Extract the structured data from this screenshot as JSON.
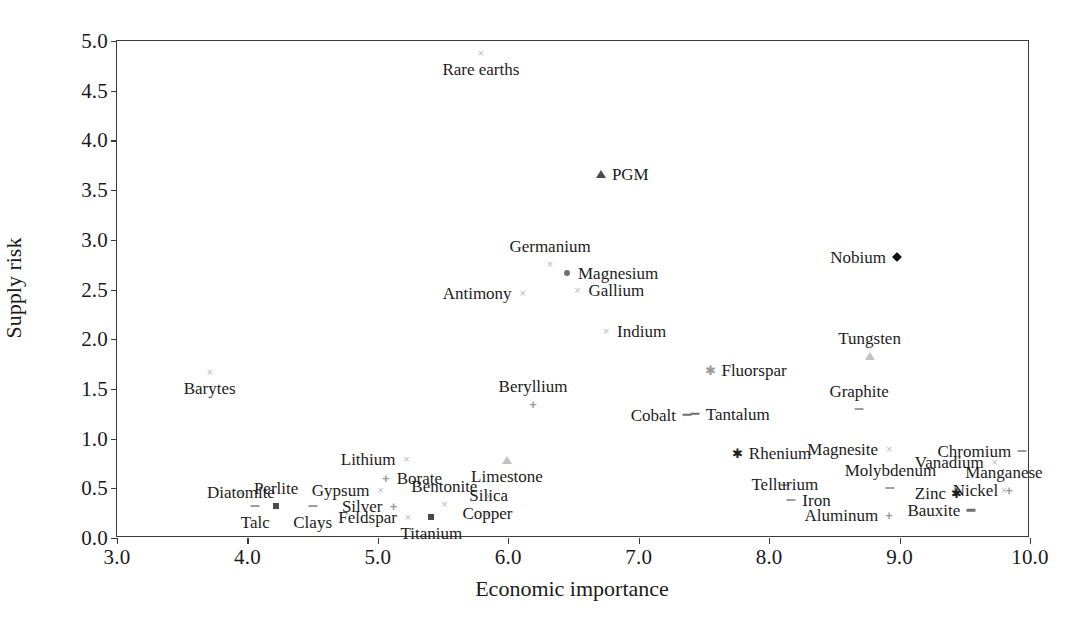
{
  "chart_data": {
    "type": "scatter",
    "title": "",
    "xlabel": "Economic importance",
    "ylabel": "Supply risk",
    "xlim": [
      3.0,
      10.0
    ],
    "ylim": [
      0.0,
      5.0
    ],
    "xticks": [
      "3.0",
      "4.0",
      "5.0",
      "6.0",
      "7.0",
      "8.0",
      "9.0",
      "10.0"
    ],
    "yticks": [
      "0.0",
      "0.5",
      "1.0",
      "1.5",
      "2.0",
      "2.5",
      "3.0",
      "3.5",
      "4.0",
      "4.5",
      "5.0"
    ],
    "grid": false,
    "legend": "none",
    "points": [
      {
        "label": "Rare earths",
        "x": 5.79,
        "y": 4.88,
        "marker": "x",
        "label_pos": "below"
      },
      {
        "label": "PGM",
        "x": 6.71,
        "y": 3.66,
        "marker": "triangle",
        "label_pos": "right"
      },
      {
        "label": "Germanium",
        "x": 6.32,
        "y": 2.76,
        "marker": "x",
        "label_pos": "above"
      },
      {
        "label": "Magnesium",
        "x": 6.45,
        "y": 2.67,
        "marker": "dot",
        "label_pos": "right"
      },
      {
        "label": "Gallium",
        "x": 6.53,
        "y": 2.5,
        "marker": "x",
        "label_pos": "right"
      },
      {
        "label": "Nobium",
        "x": 8.98,
        "y": 2.83,
        "marker": "diamond",
        "label_pos": "left"
      },
      {
        "label": "Antimony",
        "x": 6.11,
        "y": 2.46,
        "marker": "x",
        "label_pos": "left"
      },
      {
        "label": "Indium",
        "x": 6.75,
        "y": 2.08,
        "marker": "x",
        "label_pos": "right"
      },
      {
        "label": "Tungsten",
        "x": 8.77,
        "y": 1.83,
        "marker": "triangle",
        "label_pos": "above"
      },
      {
        "label": "Barytes",
        "x": 3.71,
        "y": 1.67,
        "marker": "x",
        "label_pos": "below"
      },
      {
        "label": "Fluorspar",
        "x": 7.55,
        "y": 1.69,
        "marker": "star",
        "label_pos": "right"
      },
      {
        "label": "Graphite",
        "x": 8.69,
        "y": 1.3,
        "marker": "dash",
        "label_pos": "above"
      },
      {
        "label": "Beryllium",
        "x": 6.19,
        "y": 1.35,
        "marker": "plus",
        "label_pos": "above"
      },
      {
        "label": "Tantalum",
        "x": 7.43,
        "y": 1.25,
        "marker": "dash",
        "label_pos": "right"
      },
      {
        "label": "Cobalt",
        "x": 7.37,
        "y": 1.24,
        "marker": "dash",
        "label_pos": "left"
      },
      {
        "label": "Lithium",
        "x": 5.22,
        "y": 0.79,
        "marker": "x",
        "label_pos": "left"
      },
      {
        "label": "Limestone",
        "x": 5.99,
        "y": 0.78,
        "marker": "triangle",
        "label_pos": "below"
      },
      {
        "label": "Rhenium",
        "x": 7.76,
        "y": 0.86,
        "marker": "star",
        "label_pos": "right"
      },
      {
        "label": "Magnesite",
        "x": 8.92,
        "y": 0.9,
        "marker": "x",
        "label_pos": "left"
      },
      {
        "label": "Chromium",
        "x": 9.94,
        "y": 0.88,
        "marker": "dash",
        "label_pos": "left"
      },
      {
        "label": "Vanadium",
        "x": 9.73,
        "y": 0.76,
        "marker": "x",
        "label_pos": "left"
      },
      {
        "label": "Borate",
        "x": 5.06,
        "y": 0.6,
        "marker": "plus",
        "label_pos": "right"
      },
      {
        "label": "Gypsum",
        "x": 5.02,
        "y": 0.48,
        "marker": "x",
        "label_pos": "left"
      },
      {
        "label": "Diatomite",
        "x": 3.95,
        "y": 0.45,
        "marker": "x",
        "label_pos": "center"
      },
      {
        "label": "Perlite",
        "x": 4.22,
        "y": 0.32,
        "marker": "square",
        "label_pos": "above"
      },
      {
        "label": "Bentonite",
        "x": 5.51,
        "y": 0.34,
        "marker": "x",
        "label_pos": "above"
      },
      {
        "label": "Silica",
        "x": 5.85,
        "y": 0.42,
        "marker": "x",
        "label_pos": "center"
      },
      {
        "label": "Tellurium",
        "x": 8.12,
        "y": 0.53,
        "marker": "dash",
        "label_pos": "center"
      },
      {
        "label": "Molybdenum",
        "x": 8.93,
        "y": 0.5,
        "marker": "dash",
        "label_pos": "above"
      },
      {
        "label": "Manganese",
        "x": 9.8,
        "y": 0.48,
        "marker": "x",
        "label_pos": "above"
      },
      {
        "label": "Zinc",
        "x": 9.44,
        "y": 0.45,
        "marker": "star",
        "label_pos": "left"
      },
      {
        "label": "Nickel",
        "x": 9.84,
        "y": 0.48,
        "marker": "plus",
        "label_pos": "left"
      },
      {
        "label": "Silver",
        "x": 5.12,
        "y": 0.32,
        "marker": "plus",
        "label_pos": "left"
      },
      {
        "label": "Talc",
        "x": 4.06,
        "y": 0.32,
        "marker": "dash",
        "label_pos": "below"
      },
      {
        "label": "Clays",
        "x": 4.5,
        "y": 0.32,
        "marker": "dash",
        "label_pos": "below"
      },
      {
        "label": "Copper",
        "x": 5.84,
        "y": 0.24,
        "marker": "x",
        "label_pos": "center"
      },
      {
        "label": "Iron",
        "x": 8.17,
        "y": 0.38,
        "marker": "dash",
        "label_pos": "right"
      },
      {
        "label": "Feldspar",
        "x": 5.23,
        "y": 0.21,
        "marker": "x",
        "label_pos": "left"
      },
      {
        "label": "Titanium",
        "x": 5.41,
        "y": 0.21,
        "marker": "square",
        "label_pos": "below"
      },
      {
        "label": "Aluminum",
        "x": 8.92,
        "y": 0.23,
        "marker": "plus",
        "label_pos": "left"
      },
      {
        "label": "Bauxite",
        "x": 9.55,
        "y": 0.28,
        "marker": "dash",
        "label_pos": "left"
      }
    ]
  }
}
